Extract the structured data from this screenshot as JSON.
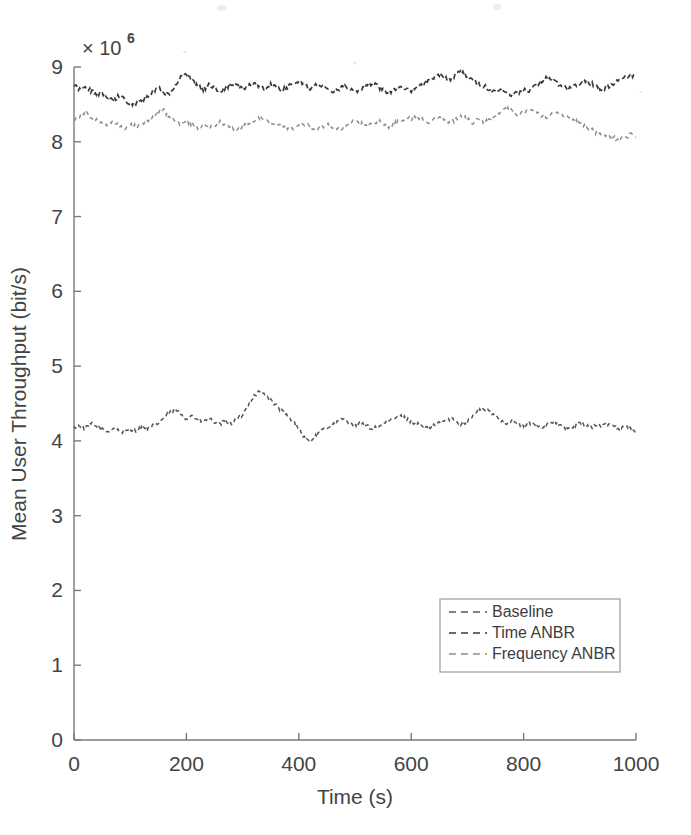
{
  "figure": {
    "kind": "scanned-matlab-figure",
    "background": "#ffffff",
    "exponent_label": "× 10",
    "exponent_power": "6"
  },
  "axes": {
    "x_label": "Time (s)",
    "y_label": "Mean User Throughput (bit/s)",
    "x_ticks": [
      "0",
      "200",
      "400",
      "600",
      "800",
      "1000"
    ],
    "y_ticks": [
      "0",
      "1",
      "2",
      "3",
      "4",
      "5",
      "6",
      "7",
      "8",
      "9"
    ]
  },
  "legend": {
    "position": "lower-right-inside",
    "entries": [
      {
        "label": "Baseline",
        "color": "#555555",
        "dash": "7,5"
      },
      {
        "label": "Time ANBR",
        "color": "#3a3a3a",
        "dash": "7,5"
      },
      {
        "label": "Frequency ANBR",
        "color": "#8d8d8d",
        "dash": "7,5"
      }
    ]
  },
  "chart_data": {
    "type": "line",
    "title": "",
    "xlabel": "Time (s)",
    "ylabel": "Mean User Throughput (bit/s)",
    "xlim": [
      0,
      1000
    ],
    "ylim": [
      0,
      9000000
    ],
    "y_scale_exponent": 6,
    "y_tick_values": [
      0,
      1000000,
      2000000,
      3000000,
      4000000,
      5000000,
      6000000,
      7000000,
      8000000,
      9000000
    ],
    "x_tick_values": [
      0,
      200,
      400,
      600,
      800,
      1000
    ],
    "grid": false,
    "legend_position": "lower right",
    "line_style": "dashed",
    "x": [
      0,
      10,
      20,
      30,
      40,
      50,
      60,
      70,
      80,
      90,
      100,
      110,
      120,
      130,
      140,
      150,
      160,
      170,
      180,
      190,
      200,
      210,
      220,
      230,
      240,
      250,
      260,
      270,
      280,
      290,
      300,
      310,
      320,
      330,
      340,
      350,
      360,
      370,
      380,
      390,
      400,
      410,
      420,
      430,
      440,
      450,
      460,
      470,
      480,
      490,
      500,
      510,
      520,
      530,
      540,
      550,
      560,
      570,
      580,
      590,
      600,
      610,
      620,
      630,
      640,
      650,
      660,
      670,
      680,
      690,
      700,
      710,
      720,
      730,
      740,
      750,
      760,
      770,
      780,
      790,
      800,
      810,
      820,
      830,
      840,
      850,
      860,
      870,
      880,
      890,
      900,
      910,
      920,
      930,
      940,
      950,
      960,
      970,
      980,
      990,
      1000
    ],
    "series": [
      {
        "name": "Baseline",
        "color": "#555555",
        "values": [
          4180000,
          4210000,
          4160000,
          4230000,
          4190000,
          4150000,
          4120000,
          4170000,
          4140000,
          4110000,
          4160000,
          4130000,
          4180000,
          4150000,
          4200000,
          4240000,
          4310000,
          4380000,
          4420000,
          4360000,
          4300000,
          4340000,
          4280000,
          4260000,
          4300000,
          4250000,
          4220000,
          4270000,
          4230000,
          4290000,
          4350000,
          4480000,
          4600000,
          4660000,
          4620000,
          4540000,
          4470000,
          4400000,
          4330000,
          4260000,
          4180000,
          4040000,
          3990000,
          4060000,
          4130000,
          4180000,
          4210000,
          4260000,
          4290000,
          4250000,
          4210000,
          4240000,
          4200000,
          4160000,
          4190000,
          4230000,
          4260000,
          4300000,
          4340000,
          4300000,
          4260000,
          4230000,
          4190000,
          4160000,
          4200000,
          4240000,
          4270000,
          4300000,
          4260000,
          4220000,
          4260000,
          4340000,
          4400000,
          4430000,
          4390000,
          4330000,
          4280000,
          4240000,
          4270000,
          4230000,
          4200000,
          4240000,
          4210000,
          4180000,
          4220000,
          4260000,
          4230000,
          4190000,
          4160000,
          4200000,
          4240000,
          4210000,
          4180000,
          4220000,
          4190000,
          4230000,
          4200000,
          4170000,
          4200000,
          4160000,
          4140000
        ]
      },
      {
        "name": "Time ANBR",
        "color": "#3a3a3a",
        "values": [
          8760000,
          8700000,
          8740000,
          8680000,
          8620000,
          8660000,
          8600000,
          8560000,
          8610000,
          8560000,
          8520000,
          8500000,
          8540000,
          8600000,
          8660000,
          8720000,
          8660000,
          8620000,
          8760000,
          8860000,
          8900000,
          8820000,
          8740000,
          8700000,
          8760000,
          8720000,
          8680000,
          8720000,
          8780000,
          8740000,
          8700000,
          8740000,
          8780000,
          8740000,
          8700000,
          8760000,
          8720000,
          8680000,
          8740000,
          8780000,
          8820000,
          8760000,
          8720000,
          8780000,
          8740000,
          8700000,
          8660000,
          8700000,
          8740000,
          8700000,
          8660000,
          8700000,
          8740000,
          8780000,
          8740000,
          8700000,
          8660000,
          8700000,
          8740000,
          8700000,
          8680000,
          8720000,
          8760000,
          8800000,
          8860000,
          8900000,
          8860000,
          8820000,
          8900000,
          8940000,
          8880000,
          8820000,
          8780000,
          8740000,
          8700000,
          8660000,
          8700000,
          8660000,
          8620000,
          8660000,
          8700000,
          8680000,
          8740000,
          8800000,
          8860000,
          8820000,
          8780000,
          8740000,
          8700000,
          8740000,
          8780000,
          8820000,
          8780000,
          8740000,
          8700000,
          8740000,
          8780000,
          8820000,
          8860000,
          8880000,
          8900000
        ]
      },
      {
        "name": "Frequency ANBR",
        "color": "#8d8d8d",
        "values": [
          8300000,
          8340000,
          8380000,
          8330000,
          8290000,
          8260000,
          8230000,
          8260000,
          8220000,
          8190000,
          8230000,
          8200000,
          8240000,
          8280000,
          8320000,
          8380000,
          8420000,
          8340000,
          8280000,
          8240000,
          8280000,
          8240000,
          8200000,
          8230000,
          8190000,
          8220000,
          8260000,
          8230000,
          8190000,
          8160000,
          8200000,
          8240000,
          8280000,
          8330000,
          8290000,
          8240000,
          8200000,
          8230000,
          8190000,
          8160000,
          8200000,
          8240000,
          8200000,
          8170000,
          8200000,
          8240000,
          8200000,
          8160000,
          8200000,
          8240000,
          8280000,
          8240000,
          8200000,
          8240000,
          8280000,
          8240000,
          8200000,
          8240000,
          8280000,
          8330000,
          8290000,
          8340000,
          8300000,
          8260000,
          8300000,
          8340000,
          8300000,
          8260000,
          8300000,
          8340000,
          8300000,
          8260000,
          8300000,
          8260000,
          8300000,
          8340000,
          8400000,
          8440000,
          8400000,
          8360000,
          8400000,
          8440000,
          8400000,
          8360000,
          8320000,
          8360000,
          8400000,
          8360000,
          8320000,
          8280000,
          8240000,
          8200000,
          8160000,
          8120000,
          8080000,
          8100000,
          8060000,
          8030000,
          8060000,
          8090000,
          8060000
        ]
      }
    ]
  }
}
